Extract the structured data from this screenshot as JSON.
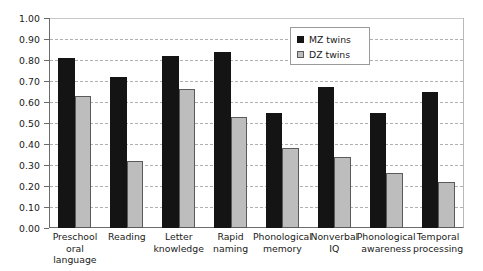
{
  "chart_data": {
    "type": "bar",
    "title": "",
    "xlabel": "",
    "ylabel": "",
    "ylim": [
      0.0,
      1.0
    ],
    "ytick_step": 0.1,
    "grid": true,
    "legend_position": "top-right",
    "categories": [
      "Preschool oral language",
      "Reading",
      "Letter knowledge",
      "Rapid naming",
      "Phonological memory",
      "Nonverbal IQ",
      "Phonological awareness",
      "Temporal processing"
    ],
    "category_lines": [
      [
        "Preschool",
        "oral language"
      ],
      [
        "Reading",
        ""
      ],
      [
        "Letter",
        "knowledge"
      ],
      [
        "Rapid",
        "naming"
      ],
      [
        "Phonological",
        "memory"
      ],
      [
        "Nonverbal",
        "IQ"
      ],
      [
        "Phonological",
        "awareness"
      ],
      [
        "Temporal",
        "processing"
      ]
    ],
    "ytick_labels": [
      "1.00",
      "0.90",
      "0.80",
      "0.70",
      "0.60",
      "0.50",
      "0.40",
      "0.30",
      "0.20",
      "0.10",
      "0.00"
    ],
    "ytick_values": [
      1.0,
      0.9,
      0.8,
      0.7,
      0.6,
      0.5,
      0.4,
      0.3,
      0.2,
      0.1,
      0.0
    ],
    "series": [
      {
        "name": "MZ twins",
        "color": "#141414",
        "values": [
          0.81,
          0.72,
          0.82,
          0.84,
          0.55,
          0.67,
          0.55,
          0.65
        ]
      },
      {
        "name": "DZ twins",
        "color": "#bdbdbd",
        "values": [
          0.63,
          0.32,
          0.66,
          0.53,
          0.38,
          0.34,
          0.26,
          0.22
        ]
      }
    ]
  },
  "legend": {
    "items": [
      {
        "label": "MZ twins",
        "swatch": "mz"
      },
      {
        "label": "DZ twins",
        "swatch": "dz"
      }
    ]
  }
}
